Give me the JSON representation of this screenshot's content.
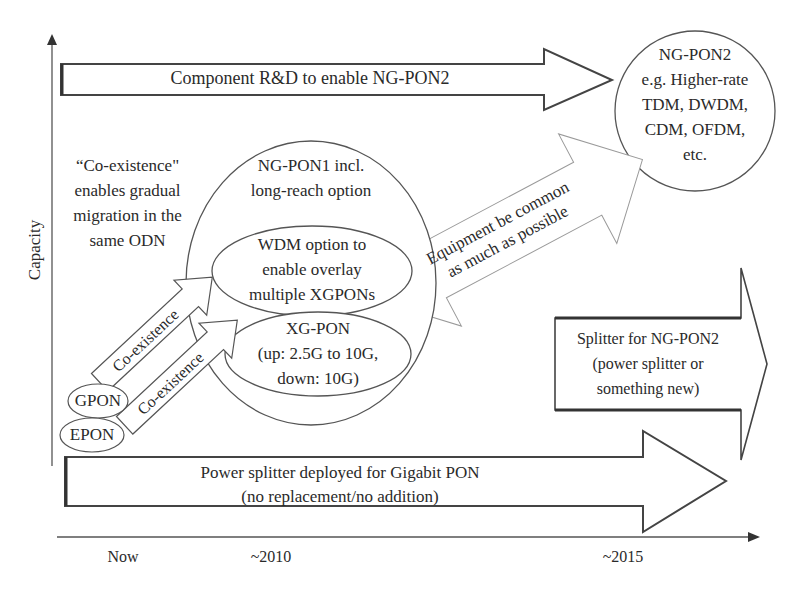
{
  "axes": {
    "y_label": "Capacity",
    "x_ticks": [
      "Now",
      "~2010",
      "~2015"
    ]
  },
  "arrows": {
    "component_rd": "Component R&D to enable NG-PON2",
    "equipment_common": [
      "Equipment be common",
      "as much as possible"
    ],
    "coexistence_upper": "Co-existence",
    "coexistence_lower": "Co-existence",
    "splitter_ngpon2": [
      "Splitter for NG-PON2",
      "(power splitter or",
      "something new)"
    ],
    "power_splitter": [
      "Power splitter deployed for Gigabit PON",
      "(no replacement/no addition)"
    ]
  },
  "nodes": {
    "ngpon2": [
      "NG-PON2",
      "e.g. Higher-rate",
      "TDM, DWDM,",
      "CDM, OFDM,",
      "etc."
    ],
    "ngpon1": [
      "NG-PON1 incl.",
      "long-reach option"
    ],
    "wdm_option": [
      "WDM option to",
      "enable overlay",
      "multiple XGPONs"
    ],
    "xgpon": [
      "XG-PON",
      "(up: 2.5G to 10G,",
      "down: 10G)"
    ],
    "gpon": "GPON",
    "epon": "EPON"
  },
  "notes": {
    "coexistence_note": [
      "“Co-existence\"",
      "enables gradual",
      "migration in the",
      "same ODN"
    ]
  }
}
